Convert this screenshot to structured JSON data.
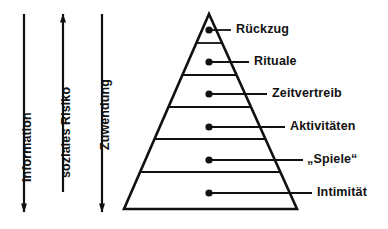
{
  "figure": {
    "type": "pyramid-diagram",
    "background_color": "#ffffff",
    "ink_color": "#111111"
  },
  "axes": [
    {
      "name": "information-axis",
      "label": "Information",
      "direction": "down",
      "arrowhead": "bottom",
      "x": 24,
      "y_top": 14,
      "y_bottom": 212,
      "label_x": 20,
      "label_bottom": 182
    },
    {
      "name": "soziales-risiko-axis",
      "label": "soziales Risiko",
      "direction": "up",
      "arrowhead": "top",
      "x": 63,
      "y_top": 14,
      "y_bottom": 192,
      "label_x": 59,
      "label_bottom": 178
    },
    {
      "name": "zuwendung-axis",
      "label": "Zuwendung",
      "direction": "down",
      "arrowhead": "bottom",
      "x": 102,
      "y_top": 14,
      "y_bottom": 212,
      "label_x": 98,
      "label_bottom": 150
    }
  ],
  "pyramid": {
    "apex_x": 209,
    "apex_y": 14,
    "base_left_x": 124,
    "base_right_x": 297,
    "base_y": 209,
    "stroke_width": 2.6,
    "divider_ys": [
      43,
      75,
      107,
      139,
      172
    ],
    "divider_stroke_width": 1.8
  },
  "tiers": [
    {
      "name": "rueckzug",
      "label": "Rückzug",
      "dot_x": 209,
      "dot_y": 30,
      "leader_end_x": 231,
      "label_x": 236,
      "label_y": 23
    },
    {
      "name": "rituale",
      "label": "Rituale",
      "dot_x": 209,
      "dot_y": 62,
      "leader_end_x": 249,
      "label_x": 254,
      "label_y": 55
    },
    {
      "name": "zeitvertreib",
      "label": "Zeitvertreib",
      "dot_x": 209,
      "dot_y": 94,
      "leader_end_x": 267,
      "label_x": 272,
      "label_y": 87
    },
    {
      "name": "aktivitaeten",
      "label": "Aktivitäten",
      "dot_x": 209,
      "dot_y": 127,
      "leader_end_x": 285,
      "label_x": 290,
      "label_y": 120
    },
    {
      "name": "spiele",
      "label": "„Spiele“",
      "dot_x": 209,
      "dot_y": 160,
      "leader_end_x": 303,
      "label_x": 307,
      "label_y": 153
    },
    {
      "name": "intimitaet",
      "label": "Intimität",
      "dot_x": 209,
      "dot_y": 193,
      "leader_end_x": 312,
      "label_x": 317,
      "label_y": 186
    }
  ]
}
